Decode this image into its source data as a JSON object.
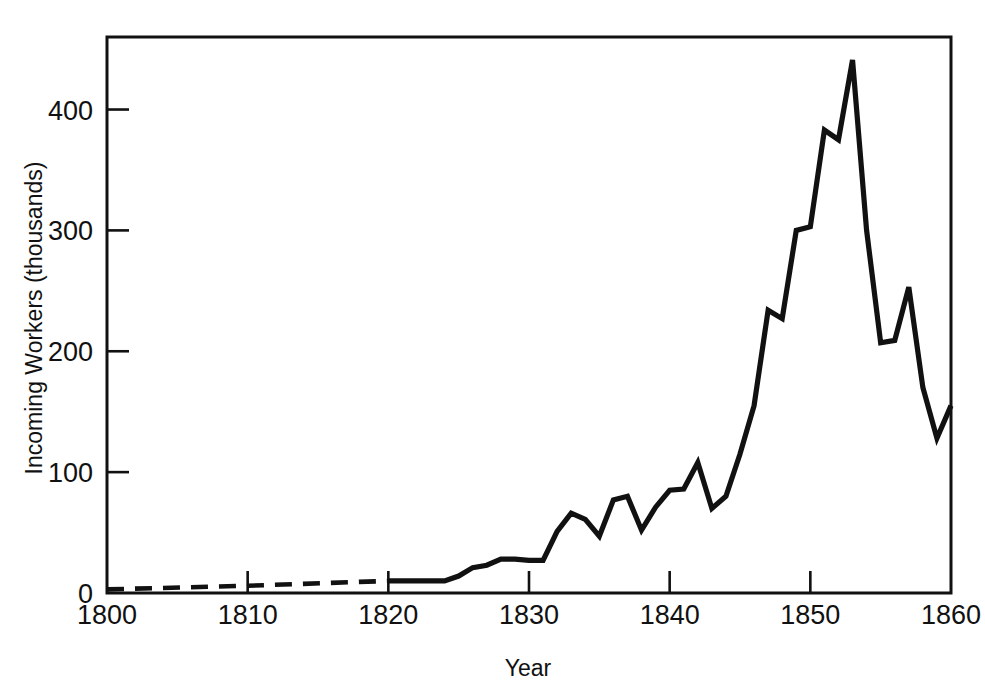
{
  "chart_data": {
    "type": "line",
    "title": "",
    "xlabel": "Year",
    "ylabel": "Incoming Workers (thousands)",
    "xlim": [
      1800,
      1860
    ],
    "ylim": [
      0,
      460
    ],
    "xticks": [
      1800,
      1810,
      1820,
      1830,
      1840,
      1850,
      1860
    ],
    "xtick_labels": [
      "1800",
      "1810",
      "1820",
      "1830",
      "1840",
      "1850",
      "1860"
    ],
    "yticks": [
      0,
      100,
      200,
      300,
      400
    ],
    "ytick_labels": [
      "0",
      "100",
      "200",
      "300",
      "400"
    ],
    "grid": false,
    "legend": false,
    "line_color": "#111111",
    "background_color": "#ffffff",
    "frame": "box",
    "series": [
      {
        "name": "Incoming Workers (estimated)",
        "style": "dashed",
        "x": [
          1800,
          1810,
          1820
        ],
        "values": [
          3,
          6,
          10
        ]
      },
      {
        "name": "Incoming Workers",
        "style": "solid",
        "x": [
          1820,
          1821,
          1822,
          1823,
          1824,
          1825,
          1826,
          1827,
          1828,
          1829,
          1830,
          1831,
          1832,
          1833,
          1834,
          1835,
          1836,
          1837,
          1838,
          1839,
          1840,
          1841,
          1842,
          1843,
          1844,
          1845,
          1846,
          1847,
          1848,
          1849,
          1850,
          1851,
          1852,
          1853,
          1854,
          1855,
          1856,
          1857,
          1858,
          1859,
          1860
        ],
        "values": [
          10,
          10,
          10,
          10,
          10,
          14,
          21,
          23,
          28,
          28,
          27,
          27,
          51,
          66,
          61,
          47,
          77,
          80,
          52,
          71,
          85,
          86,
          108,
          70,
          80,
          115,
          155,
          234,
          227,
          300,
          303,
          383,
          375,
          441,
          300,
          207,
          209,
          253,
          170,
          128,
          155
        ]
      }
    ],
    "annotations": []
  },
  "axis_labels": {
    "x_title": "Year",
    "y_title": "Incoming Workers (thousands)"
  }
}
